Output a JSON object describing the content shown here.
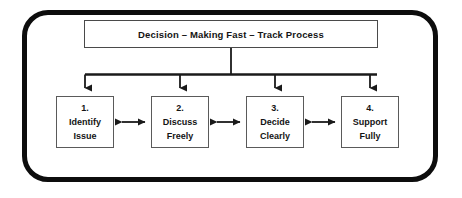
{
  "diagram": {
    "title_box": {
      "label": "Decision – Making Fast – Track Process"
    },
    "boxes": [
      {
        "number": "1.",
        "line1": "Identify",
        "line2": "Issue"
      },
      {
        "number": "2.",
        "line1": "Discuss",
        "line2": "Freely"
      },
      {
        "number": "3.",
        "line1": "Decide",
        "line2": "Clearly"
      },
      {
        "number": "4.",
        "line1": "Support",
        "line2": "Fully"
      }
    ],
    "colors": {
      "frame": "#0d0d0d",
      "box_border": "#5a5a5a",
      "title_border": "#4a4a4a",
      "text": "#141414",
      "background": "#ffffff",
      "connector": "#1a1a1a"
    }
  }
}
